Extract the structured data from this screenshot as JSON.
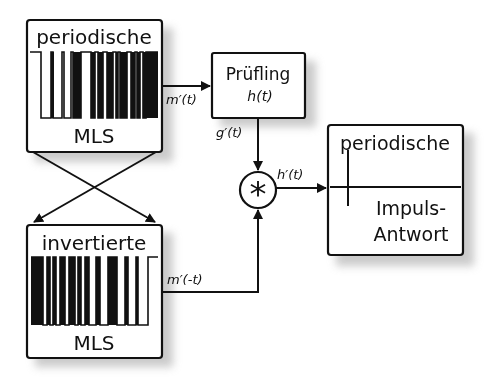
{
  "diagram": {
    "top_block": {
      "title": "periodische",
      "subtitle": "MLS"
    },
    "bottom_block": {
      "title": "invertierte",
      "subtitle": "MLS"
    },
    "dut_block": {
      "title": "Prüfling",
      "function": "h(t)"
    },
    "convolution": {
      "symbol": "*"
    },
    "result_block": {
      "title": "periodische",
      "line1": "Impuls-",
      "line2": "Antwort"
    },
    "signals": {
      "top_out": "m′(t)",
      "dut_out": "g′(t)",
      "bottom_out": "m′(-t)",
      "conv_out": "h′(t)"
    },
    "colors": {
      "stroke": "#111111",
      "background": "#ffffff",
      "shadow": "#bdbdbd"
    }
  }
}
